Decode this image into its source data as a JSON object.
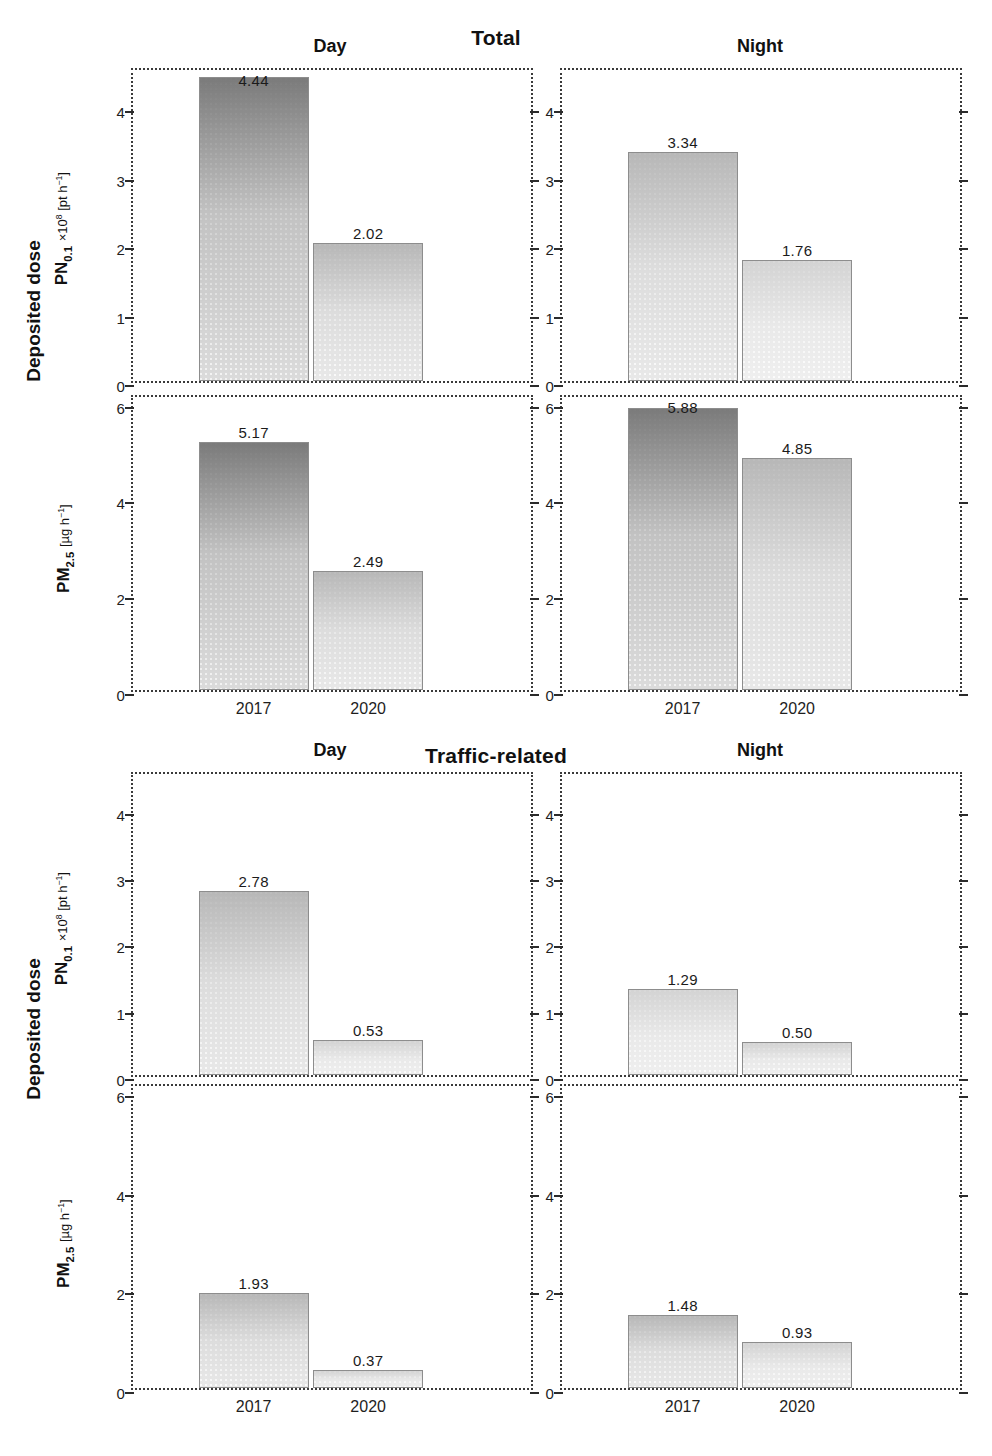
{
  "figure": {
    "sections": [
      {
        "title": "Total",
        "dose_label": "Deposited dose",
        "columns": [
          "Day",
          "Night"
        ],
        "xticks": [
          "2017",
          "2020"
        ],
        "rows": [
          {
            "metric": "PN",
            "metric_sub": "0.1",
            "unit": "×10⁸ [pt h⁻¹]",
            "ylim": [
              0,
              4.6
            ],
            "yticks": [
              0,
              1,
              2,
              3,
              4
            ],
            "panels": [
              {
                "column": "Day",
                "values": [
                  4.44,
                  2.02
                ],
                "labels": [
                  "4.44",
                  "2.02"
                ]
              },
              {
                "column": "Night",
                "values": [
                  3.34,
                  1.76
                ],
                "labels": [
                  "3.34",
                  "1.76"
                ]
              }
            ]
          },
          {
            "metric": "PM",
            "metric_sub": "2.5",
            "unit": "[µg h⁻¹]",
            "ylim": [
              0,
              6.2
            ],
            "yticks": [
              0,
              2,
              4,
              6
            ],
            "panels": [
              {
                "column": "Day",
                "values": [
                  5.17,
                  2.49
                ],
                "labels": [
                  "5.17",
                  "2.49"
                ]
              },
              {
                "column": "Night",
                "values": [
                  5.88,
                  4.85
                ],
                "labels": [
                  "5.88",
                  "4.85"
                ]
              }
            ]
          }
        ]
      },
      {
        "title": "Traffic-related",
        "dose_label": "Deposited dose",
        "columns": [
          "Day",
          "Night"
        ],
        "xticks": [
          "2017",
          "2020"
        ],
        "rows": [
          {
            "metric": "PN",
            "metric_sub": "0.1",
            "unit": "×10⁸ [pt h⁻¹]",
            "ylim": [
              0,
              4.6
            ],
            "yticks": [
              0,
              1,
              2,
              3,
              4
            ],
            "panels": [
              {
                "column": "Day",
                "values": [
                  2.78,
                  0.53
                ],
                "labels": [
                  "2.78",
                  "0.53"
                ]
              },
              {
                "column": "Night",
                "values": [
                  1.29,
                  0.5
                ],
                "labels": [
                  "1.29",
                  "0.50"
                ]
              }
            ]
          },
          {
            "metric": "PM",
            "metric_sub": "2.5",
            "unit": "[µg h⁻¹]",
            "ylim": [
              0,
              6.2
            ],
            "yticks": [
              0,
              2,
              4,
              6
            ],
            "panels": [
              {
                "column": "Day",
                "values": [
                  1.93,
                  0.37
                ],
                "labels": [
                  "1.93",
                  "0.37"
                ]
              },
              {
                "column": "Night",
                "values": [
                  1.48,
                  0.93
                ],
                "labels": [
                  "1.48",
                  "0.93"
                ]
              }
            ]
          }
        ]
      }
    ]
  },
  "chart_data": {
    "type": "bar",
    "categories": [
      "2017",
      "2020"
    ],
    "xlabel": "",
    "grid": false,
    "legend": "none",
    "panels": [
      {
        "source": "Total",
        "period": "Day",
        "metric": "PN0.1",
        "ylabel": "PN0.1 ×10⁸ [pt h⁻¹]",
        "ylim": [
          0,
          4.6
        ],
        "yticks": [
          0,
          1,
          2,
          3,
          4
        ],
        "values": [
          4.44,
          2.02
        ]
      },
      {
        "source": "Total",
        "period": "Night",
        "metric": "PN0.1",
        "ylabel": "PN0.1 ×10⁸ [pt h⁻¹]",
        "ylim": [
          0,
          4.6
        ],
        "yticks": [
          0,
          1,
          2,
          3,
          4
        ],
        "values": [
          3.34,
          1.76
        ]
      },
      {
        "source": "Total",
        "period": "Day",
        "metric": "PM2.5",
        "ylabel": "PM2.5 [µg h⁻¹]",
        "ylim": [
          0,
          6.2
        ],
        "yticks": [
          0,
          2,
          4,
          6
        ],
        "values": [
          5.17,
          2.49
        ]
      },
      {
        "source": "Total",
        "period": "Night",
        "metric": "PM2.5",
        "ylabel": "PM2.5 [µg h⁻¹]",
        "ylim": [
          0,
          6.2
        ],
        "yticks": [
          0,
          2,
          4,
          6
        ],
        "values": [
          5.88,
          4.85
        ]
      },
      {
        "source": "Traffic-related",
        "period": "Day",
        "metric": "PN0.1",
        "ylabel": "PN0.1 ×10⁸ [pt h⁻¹]",
        "ylim": [
          0,
          4.6
        ],
        "yticks": [
          0,
          1,
          2,
          3,
          4
        ],
        "values": [
          2.78,
          0.53
        ]
      },
      {
        "source": "Traffic-related",
        "period": "Night",
        "metric": "PN0.1",
        "ylabel": "PN0.1 ×10⁸ [pt h⁻¹]",
        "ylim": [
          0,
          4.6
        ],
        "yticks": [
          0,
          1,
          2,
          3,
          4
        ],
        "values": [
          1.29,
          0.5
        ]
      },
      {
        "source": "Traffic-related",
        "period": "Day",
        "metric": "PM2.5",
        "ylabel": "PM2.5 [µg h⁻¹]",
        "ylim": [
          0,
          6.2
        ],
        "yticks": [
          0,
          2,
          4,
          6
        ],
        "values": [
          1.93,
          0.37
        ]
      },
      {
        "source": "Traffic-related",
        "period": "Night",
        "metric": "PM2.5",
        "ylabel": "PM2.5 [µg h⁻¹]",
        "ylim": [
          0,
          6.2
        ],
        "yticks": [
          0,
          2,
          4,
          6
        ],
        "values": [
          1.48,
          0.93
        ]
      }
    ]
  }
}
